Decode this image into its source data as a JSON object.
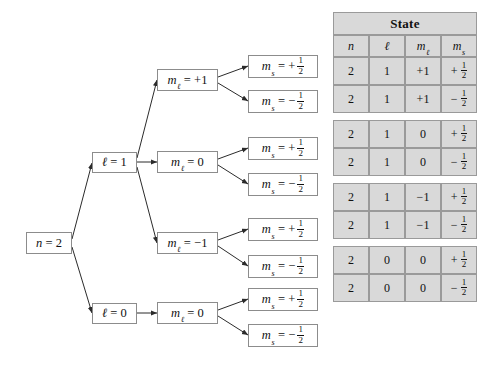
{
  "diagram": {
    "title_alt": "Quantum number tree for n = 2",
    "root": {
      "label_var": "n",
      "label_eq": "=",
      "label_val": "2"
    },
    "level_l": [
      {
        "var": "ℓ",
        "eq": "=",
        "val": "1"
      },
      {
        "var": "ℓ",
        "eq": "=",
        "val": "0"
      }
    ],
    "level_ml": [
      {
        "var": "m",
        "sub": "ℓ",
        "eq": "=",
        "val": "+1"
      },
      {
        "var": "m",
        "sub": "ℓ",
        "eq": "=",
        "val": "0"
      },
      {
        "var": "m",
        "sub": "ℓ",
        "eq": "=",
        "val": "−1"
      },
      {
        "var": "m",
        "sub": "ℓ",
        "eq": "=",
        "val": "0"
      }
    ],
    "level_ms": [
      {
        "var": "m",
        "sub": "s",
        "eq": "=",
        "sign": "+",
        "num": "1",
        "den": "2"
      },
      {
        "var": "m",
        "sub": "s",
        "eq": "=",
        "sign": "−",
        "num": "1",
        "den": "2"
      },
      {
        "var": "m",
        "sub": "s",
        "eq": "=",
        "sign": "+",
        "num": "1",
        "den": "2"
      },
      {
        "var": "m",
        "sub": "s",
        "eq": "=",
        "sign": "−",
        "num": "1",
        "den": "2"
      },
      {
        "var": "m",
        "sub": "s",
        "eq": "=",
        "sign": "+",
        "num": "1",
        "den": "2"
      },
      {
        "var": "m",
        "sub": "s",
        "eq": "=",
        "sign": "−",
        "num": "1",
        "den": "2"
      },
      {
        "var": "m",
        "sub": "s",
        "eq": "=",
        "sign": "+",
        "num": "1",
        "den": "2"
      },
      {
        "var": "m",
        "sub": "s",
        "eq": "=",
        "sign": "−",
        "num": "1",
        "den": "2"
      }
    ]
  },
  "table": {
    "title": "State",
    "columns": [
      {
        "var": "n",
        "sub": ""
      },
      {
        "var": "ℓ",
        "sub": ""
      },
      {
        "var": "m",
        "sub": "ℓ"
      },
      {
        "var": "m",
        "sub": "s"
      }
    ],
    "rows": [
      {
        "n": "2",
        "l": "1",
        "ml": "+1",
        "ms_sign": "+",
        "ms_num": "1",
        "ms_den": "2"
      },
      {
        "n": "2",
        "l": "1",
        "ml": "+1",
        "ms_sign": "−",
        "ms_num": "1",
        "ms_den": "2"
      },
      {
        "n": "2",
        "l": "1",
        "ml": "0",
        "ms_sign": "+",
        "ms_num": "1",
        "ms_den": "2"
      },
      {
        "n": "2",
        "l": "1",
        "ml": "0",
        "ms_sign": "−",
        "ms_num": "1",
        "ms_den": "2"
      },
      {
        "n": "2",
        "l": "1",
        "ml": "−1",
        "ms_sign": "+",
        "ms_num": "1",
        "ms_den": "2"
      },
      {
        "n": "2",
        "l": "1",
        "ml": "−1",
        "ms_sign": "−",
        "ms_num": "1",
        "ms_den": "2"
      },
      {
        "n": "2",
        "l": "0",
        "ml": "0",
        "ms_sign": "+",
        "ms_num": "1",
        "ms_den": "2"
      },
      {
        "n": "2",
        "l": "0",
        "ml": "0",
        "ms_sign": "−",
        "ms_num": "1",
        "ms_den": "2"
      }
    ]
  },
  "colors": {
    "cell_fill": "#d9d9d9",
    "cell_border": "#9a9a9a",
    "node_border": "#8c8c8c",
    "line": "#2b2b2b",
    "background": "#ffffff"
  }
}
